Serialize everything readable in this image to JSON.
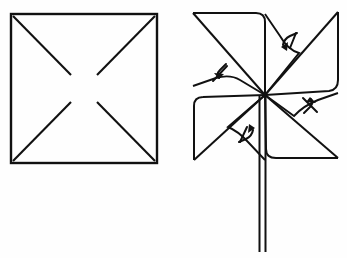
{
  "figure": {
    "title": "Pinwheel folding diagram",
    "background_color": "#fefefe",
    "ink_color": "#111111",
    "canvas": {
      "width": 347,
      "height": 258
    },
    "panels": [
      {
        "id": "panel-left",
        "name": "cut-square",
        "caption": "",
        "description": "Square sheet with four diagonal cuts from each corner stopping short of the center"
      },
      {
        "id": "panel-right",
        "name": "assembled-pinwheel",
        "caption": "",
        "description": "Corners folded to center and pinned, forming a four-blade pinwheel on a stick"
      }
    ]
  },
  "left_panel": {
    "square": {
      "x1": 11,
      "y1": 14,
      "x2": 157,
      "y2": 163,
      "stroke_width": 2.4
    },
    "cuts": [
      {
        "name": "cut-top-left",
        "x1": 13,
        "y1": 16,
        "x2": 71,
        "y2": 75
      },
      {
        "name": "cut-top-right",
        "x1": 155,
        "y1": 16,
        "x2": 97,
        "y2": 75
      },
      {
        "name": "cut-bottom-left",
        "x1": 13,
        "y1": 161,
        "x2": 71,
        "y2": 102
      },
      {
        "name": "cut-bottom-right",
        "x1": 155,
        "y1": 161,
        "x2": 97,
        "y2": 102
      }
    ],
    "center_gap": {
      "cx": 84,
      "cy": 88,
      "radius": 14
    }
  },
  "right_panel": {
    "square_corners": {
      "top_left": {
        "x": 193,
        "y": 13
      },
      "top_right": {
        "x": 338,
        "y": 12
      },
      "bottom_left": {
        "x": 194,
        "y": 160
      },
      "bottom_right": {
        "x": 338,
        "y": 158
      }
    },
    "hub": {
      "x": 265,
      "y": 95
    },
    "blades": [
      {
        "name": "blade-top-left",
        "tip": {
          "x": 193,
          "y": 13
        }
      },
      {
        "name": "blade-top-right",
        "tip": {
          "x": 338,
          "y": 12
        }
      },
      {
        "name": "blade-bottom-right",
        "tip": {
          "x": 338,
          "y": 158
        }
      },
      {
        "name": "blade-bottom-left",
        "tip": {
          "x": 194,
          "y": 160
        }
      }
    ],
    "pins": [
      {
        "name": "pin-upper-left",
        "x": 220,
        "y": 72,
        "angle": 45
      },
      {
        "name": "pin-upper-right",
        "x": 288,
        "y": 42,
        "angle": 135
      },
      {
        "name": "pin-lower-right",
        "x": 310,
        "y": 105,
        "angle": 225
      },
      {
        "name": "pin-lower-left",
        "x": 248,
        "y": 133,
        "angle": 315
      }
    ],
    "stick": {
      "name": "pinwheel-stick",
      "left_x": 259,
      "right_x": 265,
      "top_y": 95,
      "bottom_y": 252
    }
  }
}
